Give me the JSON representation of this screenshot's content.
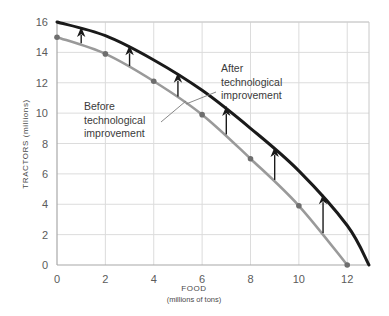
{
  "chart_data": {
    "type": "line",
    "title": "",
    "xlabel": "FOOD",
    "xlabel_sub": "(millions of tons)",
    "ylabel": "TRACTORS (millions)",
    "xlim": [
      0,
      12.9
    ],
    "ylim": [
      0,
      16
    ],
    "xticks": [
      "0",
      "2",
      "4",
      "6",
      "8",
      "10",
      "12"
    ],
    "xtick_values": [
      0,
      2,
      4,
      6,
      8,
      10,
      12
    ],
    "yticks": [
      "0",
      "2",
      "4",
      "6",
      "8",
      "10",
      "12",
      "14",
      "16"
    ],
    "ytick_values": [
      0,
      2,
      4,
      6,
      8,
      10,
      12,
      14,
      16
    ],
    "grid": true,
    "legend": "none",
    "series": [
      {
        "name": "Before technological improvement",
        "color": "#9a9a9a",
        "marker": "circle",
        "x": [
          0,
          2,
          4,
          6,
          8,
          10,
          12
        ],
        "values": [
          15,
          13.9,
          12.1,
          9.9,
          7.0,
          3.9,
          0
        ]
      },
      {
        "name": "After technological improvement",
        "color": "#1a1a1a",
        "marker": "none",
        "x": [
          0,
          2,
          4,
          6,
          8,
          10,
          12,
          12.9
        ],
        "values": [
          16,
          15.1,
          13.5,
          11.5,
          9.0,
          6.2,
          2.6,
          0
        ]
      }
    ],
    "arrows": {
      "label": "shift-arrows",
      "color": "#1a1a1a",
      "x": [
        1,
        3,
        5,
        7,
        9,
        11
      ],
      "from_values": [
        14.6,
        13.1,
        11.1,
        8.6,
        5.6,
        2.1
      ],
      "to_values": [
        15.6,
        14.4,
        12.6,
        10.4,
        7.7,
        4.6
      ]
    },
    "annotations": [
      {
        "name": "before-annotation",
        "lines": [
          "Before",
          "technological",
          "improvement"
        ],
        "text_x": 84,
        "text_y": 110,
        "leader": {
          "x1": 161,
          "y1": 122,
          "x2": 186,
          "y2": 101
        }
      },
      {
        "name": "after-annotation",
        "lines": [
          "After",
          "technological",
          "improvement"
        ],
        "text_x": 221,
        "text_y": 72,
        "leader": {
          "x1": 216,
          "y1": 92,
          "x2": 186,
          "y2": 104
        }
      }
    ]
  },
  "colors": {
    "before_curve": "#9a9a9a",
    "after_curve": "#1a1a1a",
    "grid": "#dcdcdc",
    "frame": "#c8c8c8",
    "marker": "#6e6e6e",
    "text": "#4a4a4a",
    "background": "#ffffff"
  }
}
